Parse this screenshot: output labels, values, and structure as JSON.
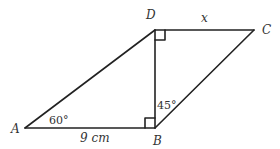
{
  "diagram": {
    "type": "parallelogram",
    "vertices": {
      "A": {
        "label": "A",
        "x": 25,
        "y": 128
      },
      "B": {
        "label": "B",
        "x": 155,
        "y": 128
      },
      "C": {
        "label": "C",
        "x": 254,
        "y": 30
      },
      "D": {
        "label": "D",
        "x": 155,
        "y": 30
      }
    },
    "labels": {
      "side_AB": "9 cm",
      "side_DC": "x",
      "angle_A": "60°",
      "angle_B": "45°"
    },
    "right_angles": [
      "D",
      "B"
    ],
    "line_color": "#222222"
  }
}
